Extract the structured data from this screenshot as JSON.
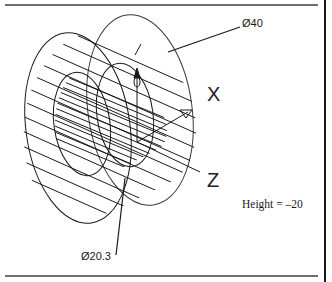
{
  "diagram": {
    "type": "wireframe-3d-cylinder",
    "labels": {
      "outer_diameter": "Ø40",
      "inner_diameter": "Ø20.3",
      "height": "Height = –20"
    },
    "axes": {
      "x": "X",
      "y": "Y",
      "z": "Z"
    },
    "colors": {
      "line": "#1a1a1a",
      "frame": "#6e6e6e",
      "background": "#ffffff"
    }
  }
}
